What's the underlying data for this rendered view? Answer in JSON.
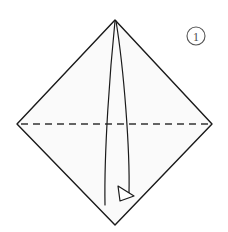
{
  "diagram": {
    "type": "origami-instruction",
    "background_color": "#ffffff",
    "step_badge": {
      "label": "1",
      "shape": "circle",
      "center_x": 196,
      "center_y": 36,
      "radius": 9,
      "stroke_color": "#555555",
      "text_color": "#4a4a4a"
    },
    "shape": {
      "name": "square-rotated-45-diamond",
      "fill_color": "#fafafa",
      "stroke_color": "#1a1a1a",
      "stroke_width": 1.4,
      "vertices": {
        "top": [
          115,
          20
        ],
        "right": [
          212,
          124
        ],
        "bottom": [
          115,
          225
        ],
        "left": [
          17,
          124
        ]
      },
      "points": "115,20 212,124 115,225 17,124"
    },
    "fold_line": {
      "name": "horizontal-valley-fold",
      "style": "dashed",
      "dash_pattern": "7 5",
      "stroke_color": "#333333",
      "stroke_width": 1.3,
      "x1": 21,
      "y1": 124,
      "x2": 209,
      "y2": 124
    },
    "motion_arrow": {
      "name": "fold-motion-arrow",
      "stroke_color": "#1a1a1a",
      "stroke_width": 1.2,
      "left_curve_path": "M 115,21 C 110,70 104,150 105,205",
      "right_curve_path": "M 116,21 C 124,70 130,150 129,193",
      "arrowhead": {
        "shape": "hollow-triangle",
        "points": "118,186 134,196 120,201",
        "fill": "#ffffff",
        "stroke_color": "#1a1a1a",
        "stroke_width": 1.2
      }
    }
  }
}
